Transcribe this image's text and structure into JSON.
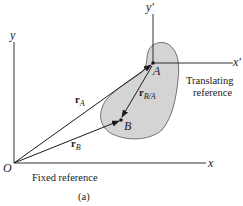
{
  "diagram": {
    "caption": "(a)",
    "fixed_frame": {
      "label": "Fixed reference",
      "origin_label": "O",
      "x_axis_label": "x",
      "y_axis_label": "y"
    },
    "translating_frame": {
      "label_line1": "Translating",
      "label_line2": "reference",
      "x_axis_label": "x′",
      "y_axis_label": "y′"
    },
    "points": {
      "A": "A",
      "B": "B"
    },
    "vectors": {
      "rA": {
        "base": "r",
        "sub": "A"
      },
      "rB": {
        "base": "r",
        "sub": "B"
      },
      "rBA": {
        "base": "r",
        "sub": "B/A"
      }
    },
    "colors": {
      "line": "#1a1a1a",
      "body_fill": "#d4d4d4",
      "body_stroke": "#555555"
    }
  }
}
